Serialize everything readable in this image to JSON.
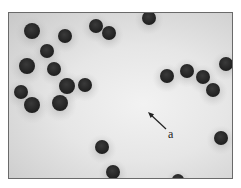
{
  "figure": {
    "annotation": {
      "label": "a",
      "arrow_from": [
        166,
        129
      ],
      "arrow_to": [
        148,
        112
      ],
      "label_pos": [
        168,
        127
      ]
    },
    "colors": {
      "cell": "#2f2f2f",
      "halo": "#9a9a9a",
      "background": "#e8e8e8",
      "border": "#6a6a6a"
    },
    "cells": [
      {
        "x": 32,
        "y": 31,
        "r": 8
      },
      {
        "x": 65,
        "y": 36,
        "r": 7
      },
      {
        "x": 96,
        "y": 26,
        "r": 7
      },
      {
        "x": 109,
        "y": 33,
        "r": 7
      },
      {
        "x": 149,
        "y": 18,
        "r": 7
      },
      {
        "x": 47,
        "y": 51,
        "r": 7
      },
      {
        "x": 27,
        "y": 66,
        "r": 8
      },
      {
        "x": 54,
        "y": 69,
        "r": 7
      },
      {
        "x": 21,
        "y": 92,
        "r": 7
      },
      {
        "x": 32,
        "y": 105,
        "r": 8
      },
      {
        "x": 67,
        "y": 86,
        "r": 8
      },
      {
        "x": 85,
        "y": 85,
        "r": 7
      },
      {
        "x": 60,
        "y": 103,
        "r": 8
      },
      {
        "x": 167,
        "y": 76,
        "r": 7
      },
      {
        "x": 187,
        "y": 71,
        "r": 7
      },
      {
        "x": 203,
        "y": 77,
        "r": 7
      },
      {
        "x": 213,
        "y": 90,
        "r": 7
      },
      {
        "x": 226,
        "y": 64,
        "r": 7
      },
      {
        "x": 221,
        "y": 138,
        "r": 7
      },
      {
        "x": 102,
        "y": 147,
        "r": 7
      },
      {
        "x": 113,
        "y": 172,
        "r": 7
      },
      {
        "x": 178,
        "y": 180,
        "r": 6
      }
    ]
  }
}
